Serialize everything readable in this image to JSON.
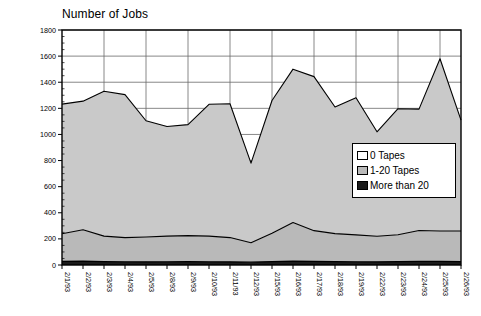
{
  "chart_data": {
    "type": "area",
    "stacked": true,
    "title": "Number of Jobs",
    "xlabel": "",
    "ylabel": "",
    "ylim": [
      0,
      1800
    ],
    "ytick_step": 200,
    "yticks": [
      0,
      200,
      400,
      600,
      800,
      1000,
      1200,
      1400,
      1600,
      1800
    ],
    "grid": true,
    "legend_position": "inside-right",
    "categories": [
      "2/1/93",
      "2/2/93",
      "2/3/93",
      "2/4/93",
      "2/5/93",
      "2/8/93",
      "2/9/93",
      "2/10/93",
      "2/11/93",
      "2/12/93",
      "2/15/93",
      "2/16/93",
      "2/17/93",
      "2/18/93",
      "2/19/93",
      "2/22/93",
      "2/23/93",
      "2/24/93",
      "2/25/93",
      "2/26/93"
    ],
    "series": [
      {
        "name": "More than 20",
        "color": "#1a1a1a",
        "values": [
          28,
          30,
          26,
          25,
          24,
          25,
          26,
          25,
          24,
          22,
          26,
          30,
          28,
          26,
          25,
          24,
          26,
          28,
          28,
          26
        ]
      },
      {
        "name": "1-20 Tapes",
        "color": "#b9b9b9",
        "values": [
          212,
          240,
          195,
          185,
          191,
          196,
          199,
          196,
          186,
          148,
          218,
          295,
          235,
          214,
          206,
          196,
          206,
          236,
          232,
          234
        ]
      },
      {
        "name": "0 Tapes",
        "color": "#c9c9c9",
        "values": [
          992,
          985,
          1110,
          1095,
          890,
          840,
          850,
          1010,
          1025,
          610,
          1016,
          1175,
          1180,
          970,
          1050,
          800,
          965,
          930,
          1320,
          850
        ]
      }
    ],
    "cumulative_totals": [
      1232,
      1255,
      1331,
      1305,
      1105,
      1061,
      1075,
      1231,
      1235,
      780,
      1260,
      1500,
      1443,
      1210,
      1281,
      1020,
      1197,
      1194,
      1580,
      1110
    ],
    "band_upper_more_than_20": [
      28,
      30,
      26,
      25,
      24,
      25,
      26,
      25,
      24,
      22,
      26,
      30,
      28,
      26,
      25,
      24,
      26,
      28,
      28,
      26
    ],
    "band_upper_1_20": [
      240,
      270,
      221,
      210,
      215,
      221,
      225,
      221,
      210,
      170,
      244,
      325,
      263,
      240,
      231,
      220,
      232,
      264,
      260,
      260
    ],
    "band_upper_0_tapes": [
      1232,
      1255,
      1331,
      1305,
      1105,
      1061,
      1075,
      1231,
      1235,
      780,
      1260,
      1500,
      1443,
      1210,
      1281,
      1020,
      1197,
      1194,
      1580,
      1110
    ]
  },
  "legend": {
    "items": [
      {
        "label": "0 Tapes",
        "swatch": "sw-0"
      },
      {
        "label": "1-20 Tapes",
        "swatch": "sw-1"
      },
      {
        "label": "More than 20",
        "swatch": "sw-2"
      }
    ]
  },
  "colors": {
    "band_0_tapes": "#c9c9c9",
    "band_1_20_tapes": "#b9b9b9",
    "band_more_than_20": "#1a1a1a",
    "axis": "#000000",
    "grid": "#555555",
    "background": "#ffffff"
  }
}
